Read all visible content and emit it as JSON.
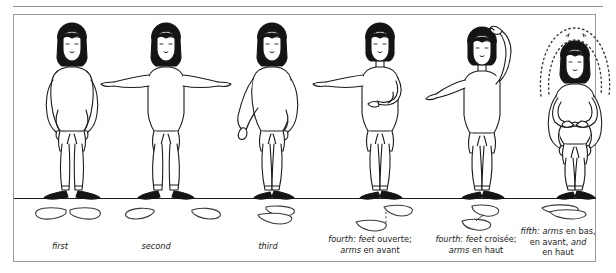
{
  "plate": {
    "title": "Ballet positions chart",
    "ground_line_color": "#1c1c1c",
    "border_color": "#9a9a9a",
    "ink_color": "#1b1b1b",
    "hair_color": "#141414",
    "shoe_color": "#141414"
  },
  "positions": [
    {
      "id": "first",
      "caption_parts": [
        {
          "text": "first",
          "italic": true
        }
      ],
      "caption_plain": "first",
      "feet": "heels-together-toes-out"
    },
    {
      "id": "second",
      "caption_parts": [
        {
          "text": "second",
          "italic": true
        }
      ],
      "caption_plain": "second",
      "feet": "feet-apart-toes-out"
    },
    {
      "id": "third",
      "caption_parts": [
        {
          "text": "third",
          "italic": true
        }
      ],
      "caption_plain": "third",
      "feet": "one-foot-crossed-half"
    },
    {
      "id": "fourth-ouverte",
      "caption_parts": [
        {
          "text": "fourth: feet",
          "italic": true
        },
        {
          "text": " ouverte;",
          "italic": false
        },
        {
          "text": "\n",
          "italic": false
        },
        {
          "text": "arms",
          "italic": true
        },
        {
          "text": " en avant",
          "italic": false
        }
      ],
      "caption_line1_a": "fourth: feet",
      "caption_line1_b": " ouverte;",
      "caption_line2_a": "arms",
      "caption_line2_b": " en avant",
      "feet": "feet-apart-front-back-open"
    },
    {
      "id": "fourth-croisee",
      "caption_parts": [
        {
          "text": "fourth: feet",
          "italic": true
        },
        {
          "text": " croisée;",
          "italic": false
        },
        {
          "text": "arms",
          "italic": true
        },
        {
          "text": " en haut",
          "italic": false
        }
      ],
      "caption_line1_a": "fourth: feet",
      "caption_line1_b": " croisée;",
      "caption_line2_a": "arms",
      "caption_line2_b": " en haut",
      "feet": "feet-crossed-front-back"
    },
    {
      "id": "fifth",
      "caption_parts": [
        {
          "text": "fifth:",
          "italic": true
        },
        {
          "text": " ",
          "italic": false
        },
        {
          "text": "arms",
          "italic": true
        },
        {
          "text": " en bas,",
          "italic": false
        },
        {
          "text": "en avant, ",
          "italic": false
        },
        {
          "text": "and",
          "italic": true
        },
        {
          "text": "en haut",
          "italic": false
        }
      ],
      "caption_line1_a": "fifth:",
      "caption_line1_b": "arms",
      "caption_line1_c": " en bas,",
      "caption_line2_a": "en avant, ",
      "caption_line2_b": "and",
      "caption_line3": "en haut",
      "feet": "feet-fully-crossed-stacked"
    }
  ]
}
